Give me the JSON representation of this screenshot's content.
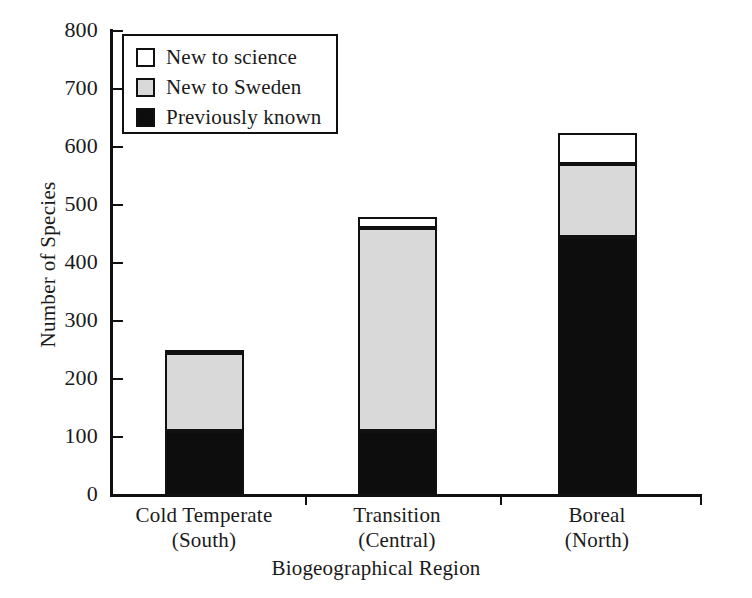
{
  "chart_data": {
    "type": "bar",
    "subtype": "stacked",
    "title": "",
    "xlabel": "Biogeographical Region",
    "ylabel": "Number of Species",
    "ylim": [
      0,
      800
    ],
    "yticks": [
      0,
      100,
      200,
      300,
      400,
      500,
      600,
      700,
      800
    ],
    "ytick_labels": [
      "0",
      "100",
      "200",
      "300",
      "400",
      "500",
      "600",
      "700",
      "800"
    ],
    "grid": false,
    "legend_position": "upper left",
    "categories": [
      "Cold Temperate\n(South)",
      "Transition\n(Central)",
      "Boreal\n(North)"
    ],
    "category_labels": [
      {
        "line1": "Cold Temperate",
        "line2": "(South)"
      },
      {
        "line1": "Transition",
        "line2": "(Central)"
      },
      {
        "line1": "Boreal",
        "line2": "(North)"
      }
    ],
    "series": [
      {
        "name": "Previously known",
        "color": "#0d0d0d",
        "values": [
          110,
          110,
          445
        ]
      },
      {
        "name": "New to Sweden",
        "color": "#d9d9d9",
        "values": [
          135,
          350,
          125
        ]
      },
      {
        "name": "New to science",
        "color": "#ffffff",
        "values": [
          5,
          20,
          55
        ]
      }
    ],
    "totals": [
      250,
      480,
      625
    ]
  },
  "axis": {
    "y_title": "Number of Species",
    "x_title": "Biogeographical Region",
    "y_tick_labels": [
      "800",
      "700",
      "600",
      "500",
      "400",
      "300",
      "200",
      "100",
      "0"
    ]
  },
  "legend": {
    "items": [
      {
        "label": "New to science",
        "swatch": "white-square-icon"
      },
      {
        "label": "New to Sweden",
        "swatch": "gray-square-icon"
      },
      {
        "label": "Previously known",
        "swatch": "black-square-icon"
      }
    ]
  },
  "categories": [
    {
      "line1": "Cold Temperate",
      "line2": "(South)"
    },
    {
      "line1": "Transition",
      "line2": "(Central)"
    },
    {
      "line1": "Boreal",
      "line2": "(North)"
    }
  ],
  "colors": {
    "known": "#0d0d0d",
    "sweden": "#d9d9d9",
    "science": "#ffffff",
    "axis": "#101010"
  }
}
